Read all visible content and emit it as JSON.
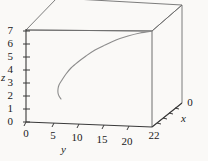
{
  "chart_data": {
    "type": "line",
    "title": "",
    "projection": "3d-box",
    "xlabel": "x",
    "ylabel": "y",
    "zlabel": "z",
    "xlim": [
      0,
      22
    ],
    "ylim": [
      0,
      22
    ],
    "zlim": [
      0,
      7
    ],
    "x_ticks": [
      {
        "label": "22",
        "value": 22
      },
      {
        "label": "0",
        "value": 0
      }
    ],
    "y_ticks": [
      {
        "label": "0",
        "value": 0
      },
      {
        "label": "5",
        "value": 5
      },
      {
        "label": "10",
        "value": 10
      },
      {
        "label": "15",
        "value": 15
      },
      {
        "label": "20",
        "value": 20
      }
    ],
    "z_ticks": [
      {
        "label": "0",
        "value": 0
      },
      {
        "label": "1",
        "value": 1
      },
      {
        "label": "2",
        "value": 2
      },
      {
        "label": "3",
        "value": 3
      },
      {
        "label": "4",
        "value": 4
      },
      {
        "label": "5",
        "value": 5
      },
      {
        "label": "6",
        "value": 6
      },
      {
        "label": "7",
        "value": 7
      }
    ],
    "grid": false,
    "legend": null,
    "series": [
      {
        "name": "trajectory",
        "color": "#8c8c8c",
        "points_px": [
          [
            152,
            31
          ],
          [
            140,
            33
          ],
          [
            128,
            36
          ],
          [
            116,
            40
          ],
          [
            105,
            45
          ],
          [
            95,
            50
          ],
          [
            86,
            56
          ],
          [
            78,
            62
          ],
          [
            71,
            68
          ],
          [
            66,
            74
          ],
          [
            62,
            80
          ],
          [
            59,
            85
          ],
          [
            58,
            89
          ],
          [
            58,
            93
          ],
          [
            59,
            96
          ],
          [
            61,
            99
          ]
        ]
      }
    ],
    "box_px": {
      "front_top_left": [
        26,
        30
      ],
      "front_top_right": [
        152,
        31
      ],
      "front_bottom_left": [
        26,
        122
      ],
      "front_bottom_right": [
        152,
        127
      ],
      "back_top_left": [
        57,
        -2
      ],
      "back_top_right": [
        182,
        5
      ],
      "back_bottom_right": [
        182,
        103
      ]
    },
    "colors": {
      "background": "#faf9f7",
      "axis": "#3a3a3a",
      "box_edge": "#6e6e6e",
      "curve": "#8c8c8c",
      "text": "#1a1a1a"
    }
  },
  "axes": {
    "z": {
      "title": "z",
      "title_pos": [
        3,
        72
      ],
      "ticks": [
        {
          "label": "0",
          "x": 13,
          "y": 116
        },
        {
          "label": "1",
          "x": 13,
          "y": 103
        },
        {
          "label": "2",
          "x": 13,
          "y": 90
        },
        {
          "label": "3",
          "x": 13,
          "y": 77
        },
        {
          "label": "4",
          "x": 13,
          "y": 64
        },
        {
          "label": "5",
          "x": 13,
          "y": 51
        },
        {
          "label": "6",
          "x": 13,
          "y": 38
        },
        {
          "label": "7",
          "x": 13,
          "y": 25
        }
      ]
    },
    "y": {
      "title": "y",
      "title_pos": [
        61,
        144
      ],
      "ticks": [
        {
          "label": "0",
          "x": 19,
          "y": 130
        },
        {
          "label": "5",
          "x": 44,
          "y": 132
        },
        {
          "label": "10",
          "x": 68,
          "y": 134
        },
        {
          "label": "15",
          "x": 93,
          "y": 136
        },
        {
          "label": "20",
          "x": 118,
          "y": 138
        }
      ]
    },
    "x": {
      "title": "x",
      "title_pos": [
        182,
        113
      ],
      "ticks": [
        {
          "label": "22",
          "x": 148,
          "y": 131
        },
        {
          "label": "0",
          "x": 186,
          "y": 98
        }
      ]
    }
  }
}
